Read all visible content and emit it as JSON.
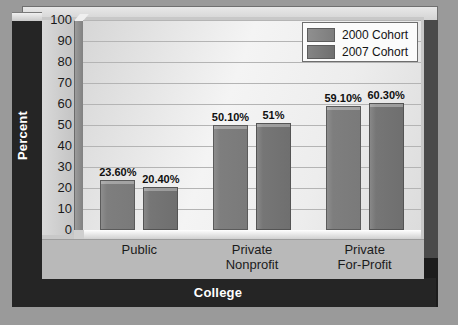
{
  "chart_data": {
    "type": "bar",
    "title": "",
    "xlabel": "College",
    "ylabel": "Percent",
    "categories": [
      "Public",
      "Private Nonprofit",
      "Private For-Profit"
    ],
    "category_lines": [
      [
        "Public"
      ],
      [
        "Private",
        "Nonprofit"
      ],
      [
        "Private",
        "For-Profit"
      ]
    ],
    "series": [
      {
        "name": "2000 Cohort",
        "color": "#7e7e7e",
        "values": [
          23.6,
          50.1,
          59.1
        ],
        "labels": [
          "23.60%",
          "50.10%",
          "59.10%"
        ]
      },
      {
        "name": "2007 Cohort",
        "color": "#6f6f6f",
        "values": [
          20.4,
          51,
          60.3
        ],
        "labels": [
          "20.40%",
          "51%",
          "60.30%"
        ]
      }
    ],
    "ylim": [
      0,
      100
    ],
    "yticks": [
      100,
      90,
      80,
      70,
      60,
      50,
      40,
      30,
      20,
      10,
      0
    ],
    "grid": true,
    "legend_position": "top-right",
    "legend_entries": [
      "2000 Cohort",
      "2007 Cohort"
    ]
  },
  "colors": {
    "frame_dark": "#252525",
    "panel": "#c8c8c8",
    "plot_bg": "#efefef",
    "gridline": "#b4b4b4",
    "series_0": "#7e7e7e",
    "series_1": "#6f6f6f",
    "axis_title_text": "#ffffff",
    "tick_text": "#1a1a1a"
  }
}
